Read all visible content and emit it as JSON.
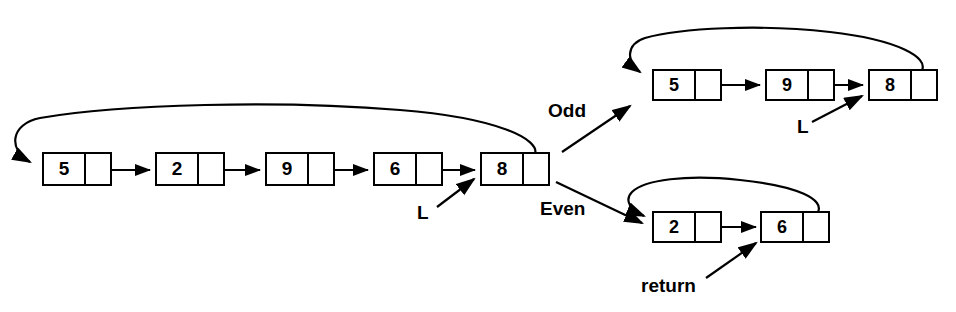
{
  "figure": {
    "stroke_color": "#000000",
    "background_color": "#ffffff"
  },
  "lists": {
    "original": {
      "name": "original-list",
      "nodes": [
        {
          "value": "5",
          "x": 42,
          "y": 152,
          "w": 70,
          "h": 34,
          "data_w": 42
        },
        {
          "value": "2",
          "x": 155,
          "y": 152,
          "w": 70,
          "h": 34,
          "data_w": 42
        },
        {
          "value": "9",
          "x": 265,
          "y": 152,
          "w": 70,
          "h": 34,
          "data_w": 42
        },
        {
          "value": "6",
          "x": 373,
          "y": 152,
          "w": 70,
          "h": 34,
          "data_w": 42
        },
        {
          "value": "8",
          "x": 480,
          "y": 152,
          "w": 70,
          "h": 34,
          "data_w": 42
        }
      ],
      "pointer_label": "L"
    },
    "odd": {
      "name": "odd-list",
      "nodes": [
        {
          "value": "5",
          "x": 652,
          "y": 69,
          "w": 70,
          "h": 32,
          "data_w": 42
        },
        {
          "value": "9",
          "x": 765,
          "y": 69,
          "w": 70,
          "h": 32,
          "data_w": 42
        },
        {
          "value": "8",
          "x": 868,
          "y": 69,
          "w": 70,
          "h": 32,
          "data_w": 42
        }
      ],
      "pointer_label": "L"
    },
    "even": {
      "name": "even-list",
      "nodes": [
        {
          "value": "2",
          "x": 652,
          "y": 211,
          "w": 70,
          "h": 32,
          "data_w": 42
        },
        {
          "value": "6",
          "x": 760,
          "y": 211,
          "w": 70,
          "h": 32,
          "data_w": 42
        }
      ],
      "pointer_label": "return"
    }
  },
  "branch_labels": {
    "odd": "Odd",
    "even": "Even"
  }
}
